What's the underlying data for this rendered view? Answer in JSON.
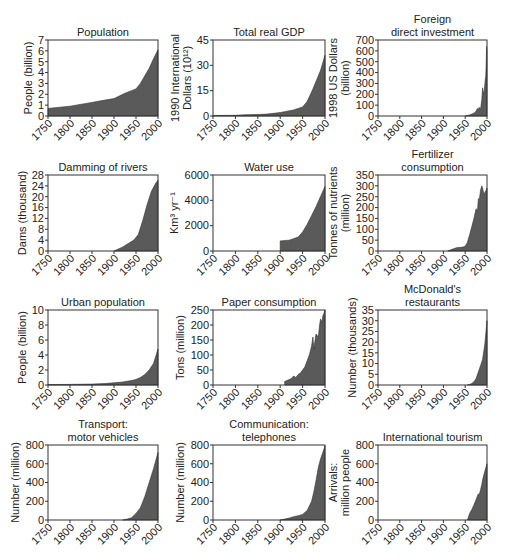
{
  "chart_data": [
    {
      "id": "population",
      "type": "area",
      "title": [
        "Population"
      ],
      "ylabel": [
        "People (billion)"
      ],
      "xlabel": "",
      "xticks": [
        1750,
        1800,
        1850,
        1900,
        1950,
        2000
      ],
      "yticks": [
        0,
        1,
        2,
        3,
        4,
        5,
        6,
        7
      ],
      "xlim": [
        1750,
        2000
      ],
      "ylim": [
        0,
        7
      ],
      "x": [
        1750,
        1800,
        1850,
        1870,
        1900,
        1925,
        1950,
        1960,
        1970,
        1980,
        1990,
        2000
      ],
      "values": [
        0.7,
        0.9,
        1.25,
        1.4,
        1.6,
        2.1,
        2.5,
        3.0,
        3.7,
        4.4,
        5.3,
        6.1
      ],
      "frame": {
        "left": 48,
        "top": 40,
        "right": 158,
        "bottom": 116
      }
    },
    {
      "id": "total-real-gdp",
      "type": "area",
      "title": [
        "Total real GDP"
      ],
      "ylabel": [
        "1990 International",
        "Dollars (10¹²)"
      ],
      "xticks": [
        1750,
        1800,
        1850,
        1900,
        1950,
        2000
      ],
      "yticks": [
        0,
        15,
        30,
        45
      ],
      "xlim": [
        1750,
        2000
      ],
      "ylim": [
        0,
        45
      ],
      "x": [
        1750,
        1800,
        1820,
        1850,
        1870,
        1900,
        1913,
        1930,
        1950,
        1960,
        1973,
        1990,
        2000
      ],
      "values": [
        0.3,
        0.4,
        0.7,
        0.9,
        1.1,
        2.0,
        2.7,
        3.6,
        5.3,
        8.5,
        16,
        27,
        36
      ],
      "frame": {
        "left": 213,
        "top": 40,
        "right": 325,
        "bottom": 116
      }
    },
    {
      "id": "foreign-direct-investment",
      "type": "area",
      "title": [
        "Foreign",
        "direct investment"
      ],
      "ylabel": [
        "1998 US Dollars",
        "(billion)"
      ],
      "xticks": [
        1750,
        1800,
        1850,
        1900,
        1950,
        2000
      ],
      "yticks": [
        0,
        100,
        200,
        300,
        400,
        500,
        600,
        700
      ],
      "xlim": [
        1750,
        2000
      ],
      "ylim": [
        0,
        700
      ],
      "x": [
        1950,
        1960,
        1970,
        1975,
        1978,
        1980,
        1982,
        1985,
        1988,
        1990,
        1992,
        1994,
        1996,
        1997,
        1998,
        1999,
        2000
      ],
      "values": [
        0,
        10,
        25,
        45,
        70,
        55,
        80,
        60,
        150,
        260,
        200,
        250,
        340,
        360,
        450,
        640,
        600
      ],
      "frame": {
        "left": 378,
        "top": 40,
        "right": 487,
        "bottom": 116
      }
    },
    {
      "id": "damming-of-rivers",
      "type": "area",
      "title": [
        "Damming of rivers"
      ],
      "ylabel": [
        "Dams (thousand)"
      ],
      "xticks": [
        1750,
        1800,
        1850,
        1900,
        1950,
        2000
      ],
      "yticks": [
        0,
        4,
        8,
        12,
        16,
        20,
        24,
        28
      ],
      "xlim": [
        1750,
        2000
      ],
      "ylim": [
        0,
        28
      ],
      "x": [
        1900,
        1920,
        1945,
        1955,
        1965,
        1975,
        1985,
        1995,
        2000
      ],
      "values": [
        0,
        1.5,
        4,
        6,
        11,
        17,
        22,
        25,
        26
      ],
      "frame": {
        "left": 48,
        "top": 175,
        "right": 158,
        "bottom": 251
      }
    },
    {
      "id": "water-use",
      "type": "area",
      "title": [
        "Water use"
      ],
      "ylabel": [
        "Km³ yr⁻¹"
      ],
      "xticks": [
        1750,
        1800,
        1850,
        1900,
        1950,
        2000
      ],
      "yticks": [
        0,
        2000,
        4000,
        6000
      ],
      "xlim": [
        1750,
        2000
      ],
      "ylim": [
        0,
        6000
      ],
      "x": [
        1900,
        1900,
        1920,
        1940,
        1950,
        1960,
        1970,
        1980,
        1990,
        2000
      ],
      "values": [
        0,
        800,
        850,
        1100,
        1500,
        2100,
        2800,
        3500,
        4300,
        5100
      ],
      "frame": {
        "left": 213,
        "top": 175,
        "right": 325,
        "bottom": 251
      }
    },
    {
      "id": "fertilizer-consumption",
      "type": "area",
      "title": [
        "Fertilizer",
        "consumption"
      ],
      "ylabel": [
        "Tonnes of nutrients",
        "(million)"
      ],
      "xticks": [
        1750,
        1800,
        1850,
        1900,
        1950,
        2000
      ],
      "yticks": [
        0,
        50,
        100,
        150,
        200,
        250,
        300,
        350
      ],
      "xlim": [
        1750,
        2000
      ],
      "ylim": [
        0,
        350
      ],
      "x": [
        1910,
        1920,
        1930,
        1940,
        1945,
        1950,
        1955,
        1960,
        1965,
        1970,
        1975,
        1978,
        1980,
        1983,
        1985,
        1988,
        1990,
        1993,
        1995,
        1998,
        2000
      ],
      "values": [
        0,
        8,
        15,
        17,
        18,
        22,
        40,
        75,
        110,
        150,
        195,
        180,
        240,
        245,
        280,
        300,
        290,
        260,
        270,
        280,
        290
      ],
      "frame": {
        "left": 378,
        "top": 175,
        "right": 487,
        "bottom": 251
      }
    },
    {
      "id": "urban-population",
      "type": "area",
      "title": [
        "Urban population"
      ],
      "ylabel": [
        "People (billion)"
      ],
      "xticks": [
        1750,
        1800,
        1850,
        1900,
        1950,
        2000
      ],
      "yticks": [
        0,
        2,
        4,
        6,
        8,
        10
      ],
      "xlim": [
        1750,
        2000
      ],
      "ylim": [
        0,
        10
      ],
      "x": [
        1750,
        1800,
        1850,
        1880,
        1900,
        1920,
        1940,
        1950,
        1960,
        1970,
        1980,
        1990,
        2000
      ],
      "values": [
        0.05,
        0.08,
        0.12,
        0.2,
        0.3,
        0.4,
        0.6,
        0.75,
        1.0,
        1.4,
        2.0,
        2.9,
        4.8
      ],
      "frame": {
        "left": 48,
        "top": 310,
        "right": 158,
        "bottom": 385
      }
    },
    {
      "id": "paper-consumption",
      "type": "area",
      "title": [
        "Paper consumption"
      ],
      "ylabel": [
        "Tons (million)"
      ],
      "xticks": [
        1750,
        1800,
        1850,
        1900,
        1950,
        2000
      ],
      "yticks": [
        0,
        50,
        100,
        150,
        200,
        250
      ],
      "xlim": [
        1750,
        2000
      ],
      "ylim": [
        0,
        250
      ],
      "x": [
        1910,
        1910,
        1920,
        1925,
        1930,
        1935,
        1940,
        1945,
        1950,
        1955,
        1960,
        1965,
        1970,
        1973,
        1975,
        1978,
        1980,
        1985,
        1988,
        1990,
        1993,
        1995,
        1998,
        2000
      ],
      "values": [
        0,
        12,
        18,
        22,
        30,
        25,
        35,
        40,
        50,
        60,
        80,
        100,
        130,
        160,
        120,
        150,
        170,
        160,
        200,
        220,
        210,
        230,
        240,
        250
      ],
      "frame": {
        "left": 213,
        "top": 310,
        "right": 325,
        "bottom": 385
      }
    },
    {
      "id": "mcdonalds-restaurants",
      "type": "area",
      "title": [
        "McDonald's",
        "restaurants"
      ],
      "ylabel": [
        "Number (thousands)"
      ],
      "xticks": [
        1750,
        1800,
        1850,
        1900,
        1950,
        2000
      ],
      "yticks": [
        0,
        5,
        10,
        15,
        20,
        25,
        30,
        35
      ],
      "xlim": [
        1750,
        2000
      ],
      "ylim": [
        0,
        35
      ],
      "x": [
        1955,
        1960,
        1965,
        1970,
        1975,
        1980,
        1985,
        1990,
        1995,
        2000
      ],
      "values": [
        0,
        0.3,
        0.7,
        1.5,
        3,
        6,
        9,
        12,
        19,
        30
      ],
      "frame": {
        "left": 378,
        "top": 310,
        "right": 487,
        "bottom": 385
      }
    },
    {
      "id": "transport-motor-vehicles",
      "type": "area",
      "title": [
        "Transport:",
        "motor vehicles"
      ],
      "ylabel": [
        "Number (million)"
      ],
      "xticks": [
        1750,
        1800,
        1850,
        1900,
        1950,
        2000
      ],
      "yticks": [
        0,
        200,
        400,
        600,
        800
      ],
      "xlim": [
        1750,
        2000
      ],
      "ylim": [
        0,
        800
      ],
      "x": [
        1920,
        1930,
        1940,
        1950,
        1960,
        1970,
        1980,
        1990,
        2000
      ],
      "values": [
        0,
        10,
        25,
        70,
        130,
        250,
        400,
        550,
        720
      ],
      "frame": {
        "left": 48,
        "top": 445,
        "right": 158,
        "bottom": 520
      }
    },
    {
      "id": "communication-telephones",
      "type": "area",
      "title": [
        "Communication:",
        "telephones"
      ],
      "ylabel": [
        "Number (million)"
      ],
      "xticks": [
        1750,
        1800,
        1850,
        1900,
        1950,
        2000
      ],
      "yticks": [
        0,
        200,
        400,
        600,
        800
      ],
      "xlim": [
        1750,
        2000
      ],
      "ylim": [
        0,
        800
      ],
      "x": [
        1900,
        1910,
        1920,
        1930,
        1940,
        1950,
        1960,
        1970,
        1975,
        1980,
        1985,
        1990,
        1995,
        2000
      ],
      "values": [
        0,
        10,
        20,
        35,
        45,
        60,
        100,
        200,
        300,
        420,
        560,
        650,
        720,
        790
      ],
      "frame": {
        "left": 213,
        "top": 445,
        "right": 325,
        "bottom": 520
      }
    },
    {
      "id": "international-tourism",
      "type": "area",
      "title": [
        "International tourism"
      ],
      "ylabel": [
        "Arrivals:",
        "million people"
      ],
      "xticks": [
        1750,
        1800,
        1850,
        1900,
        1950,
        2000
      ],
      "yticks": [
        0,
        200,
        400,
        600,
        800
      ],
      "xlim": [
        1750,
        2000
      ],
      "ylim": [
        0,
        800
      ],
      "x": [
        1955,
        1960,
        1965,
        1970,
        1975,
        1980,
        1982,
        1985,
        1988,
        1990,
        1995,
        2000
      ],
      "values": [
        0,
        70,
        110,
        160,
        220,
        280,
        270,
        320,
        380,
        430,
        520,
        600
      ],
      "frame": {
        "left": 378,
        "top": 445,
        "right": 487,
        "bottom": 520
      }
    }
  ],
  "style": {
    "fill": "#5a5a5a",
    "stroke": "#333333",
    "axis": "#333333"
  }
}
